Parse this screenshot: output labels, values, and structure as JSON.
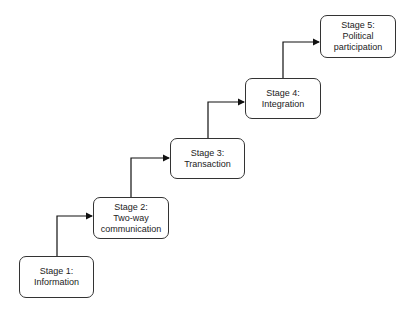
{
  "diagram": {
    "type": "staircase-flow",
    "stages": [
      {
        "id": "stage1",
        "title": "Stage 1:",
        "label": "Information",
        "lines": [
          "Stage 1:",
          "Information"
        ]
      },
      {
        "id": "stage2",
        "title": "Stage 2:",
        "label": "Two-way communication",
        "lines": [
          "Stage 2:",
          "Two-way",
          "communication"
        ]
      },
      {
        "id": "stage3",
        "title": "Stage 3:",
        "label": "Transaction",
        "lines": [
          "Stage 3:",
          "Transaction"
        ]
      },
      {
        "id": "stage4",
        "title": "Stage 4:",
        "label": "Integration",
        "lines": [
          "Stage 4:",
          "Integration"
        ]
      },
      {
        "id": "stage5",
        "title": "Stage 5:",
        "label": "Political participation",
        "lines": [
          "Stage 5:",
          "Political",
          "participation"
        ]
      }
    ],
    "edges": [
      {
        "from": "stage1",
        "to": "stage2"
      },
      {
        "from": "stage2",
        "to": "stage3"
      },
      {
        "from": "stage3",
        "to": "stage4"
      },
      {
        "from": "stage4",
        "to": "stage5"
      }
    ],
    "colors": {
      "stroke": "#333333",
      "fill": "#ffffff",
      "text": "#222222"
    }
  }
}
